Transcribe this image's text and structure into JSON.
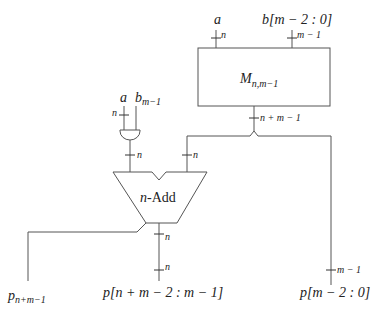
{
  "diagram": {
    "type": "circuit",
    "inputs": {
      "mult_a": "a",
      "mult_b": "b[m − 2 : 0]",
      "and_a": "a",
      "and_b_base": "b",
      "and_b_sub": "m−1"
    },
    "bus_widths": {
      "mult_a": "n",
      "mult_b": "m − 1",
      "mult_out": "n + m − 1",
      "and_a": "n",
      "and_out": "n",
      "adder_right_in": "n",
      "adder_out": "n",
      "out_mid": "n",
      "out_right": "m − 1"
    },
    "blocks": {
      "multiplier_base": "M",
      "multiplier_sub": "n,m−1",
      "adder_prefix": "n",
      "adder_suffix": "-Add"
    },
    "outputs": {
      "p_msb_base": "p",
      "p_msb_sub": "n+m−1",
      "p_mid": "p[n + m − 2 : m − 1]",
      "p_low": "p[m − 2 : 0]"
    }
  }
}
